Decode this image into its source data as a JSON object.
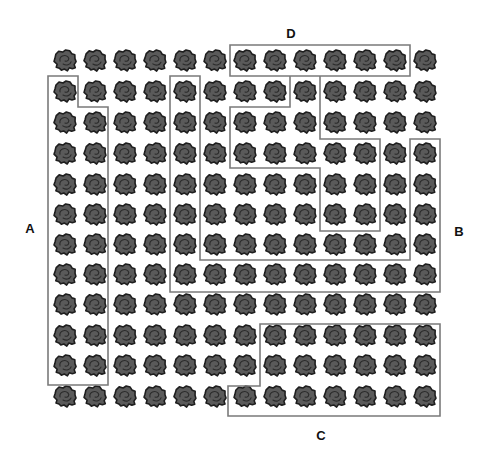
{
  "figure": {
    "width": 481,
    "height": 455,
    "grid": {
      "columns": 13,
      "rows": 12,
      "item_icon": "rock-cluster-icon",
      "col_centers": [
        65,
        95,
        125,
        155,
        185,
        215,
        245,
        275,
        305,
        335,
        365,
        395,
        425
      ],
      "row_centers": [
        60,
        91,
        122,
        153,
        184,
        214,
        244,
        274,
        304,
        335,
        365,
        396
      ],
      "item_fill": "#5a5a5a",
      "item_stroke": "#1e1e1e"
    },
    "outline_color": "#7a7a7a",
    "regions": [
      {
        "id": "A",
        "label": "A",
        "label_pos": [
          30,
          228
        ],
        "shape": "polygon",
        "points": [
          [
            48,
            76
          ],
          [
            78,
            76
          ],
          [
            78,
            107
          ],
          [
            108,
            107
          ],
          [
            108,
            385
          ],
          [
            48,
            385
          ]
        ]
      },
      {
        "id": "B",
        "label": "B",
        "label_pos": [
          459,
          231
        ],
        "shape": "polygon",
        "points": [
          [
            170,
            76
          ],
          [
            200,
            76
          ],
          [
            200,
            260
          ],
          [
            410,
            260
          ],
          [
            410,
            139
          ],
          [
            440,
            139
          ],
          [
            440,
            292
          ],
          [
            170,
            292
          ]
        ]
      },
      {
        "id": "C",
        "label": "C",
        "label_pos": [
          321,
          435
        ],
        "shape": "polygon",
        "points": [
          [
            260,
            324
          ],
          [
            440,
            324
          ],
          [
            440,
            416
          ],
          [
            228,
            416
          ],
          [
            228,
            386
          ],
          [
            260,
            386
          ]
        ]
      },
      {
        "id": "D",
        "label": "D",
        "label_pos": [
          291,
          33
        ],
        "shape": "polygon",
        "points": [
          [
            230,
            45
          ],
          [
            410,
            45
          ],
          [
            410,
            76
          ],
          [
            230,
            76
          ]
        ]
      },
      {
        "id": "inner",
        "label": "",
        "shape": "polyline",
        "points": [
          [
            290,
            76
          ],
          [
            290,
            107
          ],
          [
            230,
            107
          ],
          [
            230,
            168
          ],
          [
            320,
            168
          ],
          [
            320,
            231
          ],
          [
            380,
            231
          ],
          [
            380,
            139
          ],
          [
            320,
            139
          ],
          [
            320,
            76
          ]
        ]
      }
    ],
    "labels": {
      "A": "A",
      "B": "B",
      "C": "C",
      "D": "D"
    }
  }
}
